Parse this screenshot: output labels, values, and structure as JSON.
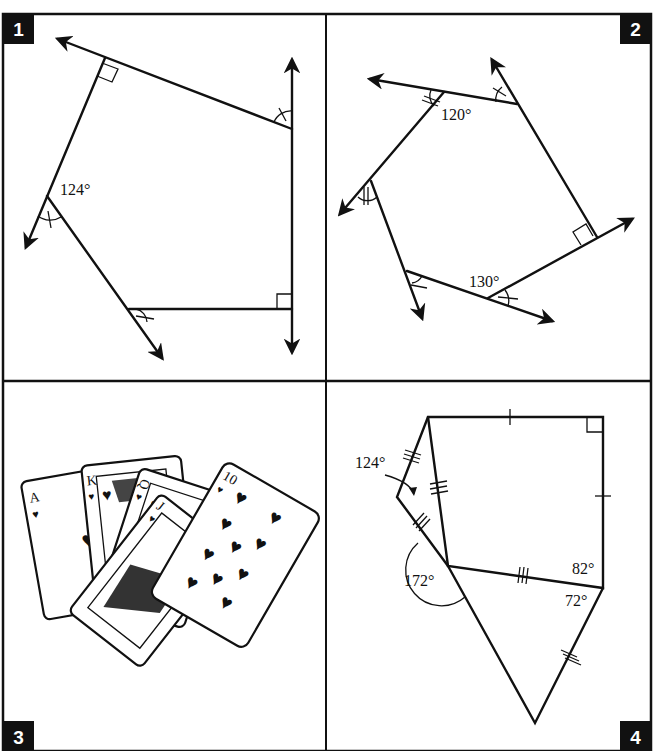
{
  "page": {
    "title_partial": "Polygon Angles worksheet (title cropped at top)"
  },
  "panels": [
    {
      "number": "1",
      "type": "exterior-angles-pentagon",
      "labels": [
        "124°"
      ],
      "marks": [
        "right-angle",
        "right-angle",
        "single-tick-arc",
        "single-tick-arc",
        "single-tick-arc"
      ]
    },
    {
      "number": "2",
      "type": "exterior-angles-hexagon",
      "labels": [
        "120°",
        "130°"
      ],
      "marks": [
        "right-angle",
        "double-tick-arc",
        "double-tick-arc",
        "single-tick-arc",
        "single-tick-arc",
        "single-tick-arc"
      ]
    },
    {
      "number": "3",
      "type": "playing-cards-illustration",
      "cards": [
        {
          "rank": "A",
          "suit": "heart"
        },
        {
          "rank": "K",
          "suit": "heart"
        },
        {
          "rank": "Q",
          "suit": "heart"
        },
        {
          "rank": "J",
          "suit": "heart"
        },
        {
          "rank": "10",
          "suit": "heart"
        }
      ]
    },
    {
      "number": "4",
      "type": "composite-polygons",
      "labels": [
        "124°",
        "172°",
        "82°",
        "72°"
      ],
      "marks": [
        "right-angle",
        "single-tick",
        "single-tick",
        "triple-tick",
        "triple-tick",
        "triple-tick",
        "triple-tick",
        "triple-tick"
      ]
    }
  ]
}
